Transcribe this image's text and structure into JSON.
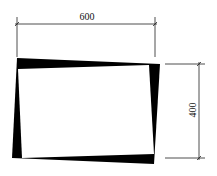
{
  "diagram": {
    "type": "dimensioned-frame-sketch",
    "colors": {
      "background": "#ffffff",
      "ink": "#000000",
      "dimension_line": "#222222"
    },
    "width_dimension": {
      "label": "600"
    },
    "height_dimension": {
      "label": "400"
    },
    "frame": {
      "outer_corners": [
        [
          17,
          58
        ],
        [
          160,
          64
        ],
        [
          154,
          164
        ],
        [
          12,
          158
        ]
      ],
      "inner_corners": [
        [
          18,
          69
        ],
        [
          149,
          65
        ],
        [
          154,
          154
        ],
        [
          22,
          158
        ]
      ]
    }
  }
}
